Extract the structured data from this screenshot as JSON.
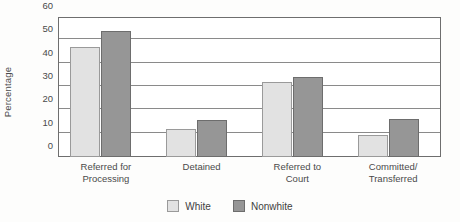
{
  "chart_data": {
    "type": "bar",
    "title": "",
    "xlabel": "",
    "ylabel": "Percentage",
    "ylim": [
      0,
      60
    ],
    "yticks": [
      0,
      10,
      20,
      30,
      40,
      50,
      60
    ],
    "ytick_labels": [
      "0",
      "10",
      "20",
      "30",
      "40",
      "50",
      "60"
    ],
    "grid": true,
    "legend_position": "bottom-center",
    "categories": [
      "Referred for Processing",
      "Detained",
      "Referred to Court",
      "Committed/ Transferred"
    ],
    "category_lines": [
      [
        "Referred for",
        "Processing"
      ],
      [
        "Detained",
        ""
      ],
      [
        "Referred to",
        "Court"
      ],
      [
        "Committed/",
        "Transferred"
      ]
    ],
    "series": [
      {
        "name": "White",
        "color": "#e2e2e2",
        "border_color": "#9a9a9a",
        "values": [
          47,
          12,
          32,
          9.5
        ]
      },
      {
        "name": "Nonwhite",
        "color": "#969696",
        "border_color": "#6d6d6d",
        "values": [
          54,
          16,
          34.5,
          16.5
        ]
      }
    ]
  },
  "axis": {
    "y_title": "Percentage"
  },
  "legend": {
    "items": [
      {
        "label": "White",
        "swatch": "white-swatch"
      },
      {
        "label": "Nonwhite",
        "swatch": "nonwhite-swatch"
      }
    ]
  }
}
